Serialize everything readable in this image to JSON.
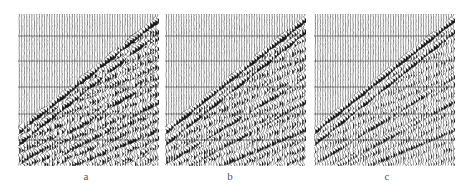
{
  "figure": {
    "panels": [
      {
        "id": "a",
        "label": "a",
        "x": 18,
        "noise": 0.9,
        "seed": 11
      },
      {
        "id": "b",
        "label": "b",
        "x": 165,
        "noise": 0.75,
        "seed": 23
      },
      {
        "id": "c",
        "label": "c",
        "x": 314,
        "noise": 0.55,
        "seed": 37
      }
    ],
    "trace_count": 56,
    "timing_lines_y": [
      22,
      47,
      73,
      100,
      126
    ],
    "colors": {
      "trace": "#1a1a1a",
      "background": "#ffffff",
      "label": "#555555"
    }
  }
}
